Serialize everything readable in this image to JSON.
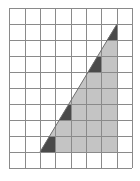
{
  "diagram": {
    "type": "grid-triangle",
    "grid": {
      "columns": 8,
      "rows": 10,
      "x_lines": [
        9,
        25,
        40,
        55,
        71,
        86,
        101,
        117,
        132
      ],
      "y_lines": [
        8,
        24,
        40,
        56,
        72,
        88,
        104,
        120,
        136,
        152,
        168
      ],
      "line_color": "#8a8a8a",
      "background": "#ffffff"
    },
    "triangle": {
      "vertices_grid": [
        [
          2,
          9
        ],
        [
          7,
          1
        ],
        [
          7,
          9
        ]
      ],
      "vertices_px": [
        [
          40,
          152
        ],
        [
          117,
          24
        ],
        [
          117,
          152
        ]
      ],
      "fill": "#c4c4c4",
      "stroke": "#6e6e6e",
      "base_cells": 5,
      "height_cells": 8
    },
    "dark_regions": {
      "fill": "#4a4a4a",
      "polygons": [
        "107,40 117,40 117,24",
        "88,72 101,72 101,56 97.5,56",
        "59,120 71,120 71,104 69,104",
        "40,152 55,152 55,136 49.6,136"
      ]
    }
  }
}
